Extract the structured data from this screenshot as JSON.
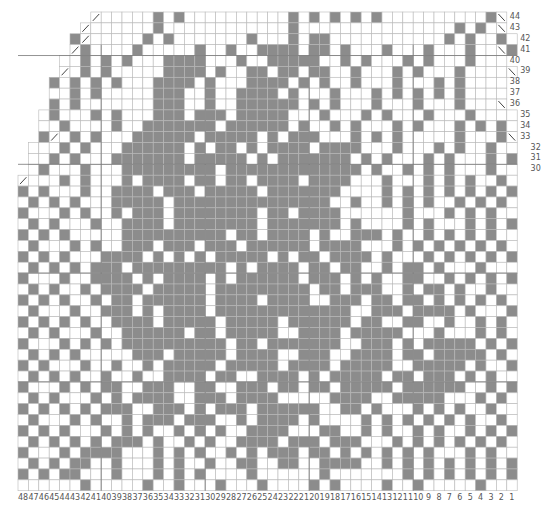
{
  "colors": {
    "dark": "#8c8c8c",
    "light": "#ffffff",
    "grid": "#b8b8b8",
    "major": "#777777"
  },
  "columns": 48,
  "rows": 44,
  "column_labels": [
    "48",
    "47",
    "46",
    "45",
    "44",
    "43",
    "42",
    "41",
    "40",
    "39",
    "38",
    "37",
    "36",
    "35",
    "34",
    "33",
    "32",
    "31",
    "30",
    "29",
    "28",
    "27",
    "26",
    "25",
    "24",
    "23",
    "22",
    "21",
    "20",
    "19",
    "18",
    "17",
    "16",
    "15",
    "14",
    "13",
    "12",
    "11",
    "10",
    "9",
    "8",
    "7",
    "6",
    "5",
    "4",
    "3",
    "2",
    "1"
  ],
  "row_labels": [
    "1",
    "2",
    "3",
    "4",
    "5",
    "6",
    "7",
    "8",
    "9",
    "10",
    "11",
    "12",
    "13",
    "14",
    "15",
    "16",
    "17",
    "18",
    "19",
    "20",
    "21",
    "22",
    "23",
    "24",
    "25",
    "26",
    "27",
    "28",
    "29",
    "30",
    "31",
    "32",
    "33",
    "34",
    "35",
    "36",
    "37",
    "38",
    "39",
    "40",
    "41",
    "42",
    "43",
    "44"
  ],
  "legend": {
    "dark_cell": "contrast color",
    "light_cell": "main color",
    "diagonal": "decrease"
  },
  "pattern_rows_top_to_bottom": [
    "       /.....#.#..........#.#.#.#.#..........#\\      ",
    "      /......#............#...............#.#.\\     ",
    "     #/.....#.#.......#...#.##...........#.#..#.    ",
    "     /#....#.....#..#..####.##.#...#...#...#..\\#    ",
    "    ..#.#.#...####...#..#####..#.#...#.#...#...    ",
    "    /.#.#.....####.#..##.##.##..#...#.#...#....\\   ",
    "   #.#.#.#...####.#...####.#.#..#...#...#.#....   ",
    "   ..#.#.....###..#..####.#...#...#.#.#.#.#....   ",
    "   #.#.......###..#..######.#.#...#...#...#...\\   ",
    "  .#...#.#...###.###.#####...#...#.#...#...#....  ",
    "  ..#....#..#######.######.#..#.#...#.#...#.#.#.  ",
    "  #/.#.#...######.#####.#.###...#.#.#.....#...#\\  ",
    " ...#.#...######.#.##.#.####.####...#...#.#..#... ",
    " ..#.#...#######.#####.#.#######.#.#...#.#...#.#. ",
    " .#...#...#########.#############.#..#.#.#...#... ",
    "/...#.#...#.####.##.##.####.####...#...#.#.#..#.\\#",
    "#.#...#..####.###.#####.#######....#.#.#.#.#.#.#.#",
    ".#.#.#...#####.###############..#..#.#.#..#.#.#..#",
    "#...#.#..#.###.########.##.####......#...#.#.#...#",
    ".#.#...#..####.########.#######.#....#.#...#.#.#..",
    "#.#.#.....##########.##.####.#..###.#..#.#.#.#...#",
    ".#...#.#..###.###.###.######.####...#.#.#.#.#.#...",
    "#.#.#...####.#.#.#.#####.#.##.####.#...#.#.#.#.#.#",
    ".#.#.#.###.#########.#.####.##.##..#.##.#...#...#.",
    "#...#..####.#.####.#.######.###.#.#..##..#.#.#.#.#",
    ".#.#..#.####.#####.#########.##.###..#.##.#..#..#.",
    "#.#.#..#.##.######.####.####..###.##.##.#.#.#.#..#",
    ".#...#..###.#.####.#############..###.####.#...#..",
    "#.#.#.#..####.#####.#####.######.##..##..#..#.#..#",
    ".#.#...#..######.##.#####..####.#####...#...#.#..#",
    "#...#.#.#.##########.##.#######..###.#.#####.#.#..",
    ".#.#.#.....###.#####.####..###..####.##.#####.#.#.",
    "#.#...#..#..#.#####.#####.####.#####..#####.#..#..",
    ".#.#.#..#..#..####.##..####.#.#####.##.###.#.#..#.",
    "#...#.#.##..###..##..###.##.##.#####.######..#.#.#",
    ".#.#...#.#.####..###.####.....####..#####...#.#.#.",
    "#.#.#.#.###..###.#.###.######..##.#...#.#.#..#..#.",
    ".#...#.#..#.###.###..#.####.#....#.#.#.#.#.#..#.#.",
    "#.#.#...#.#.#..#.#.#..####...##..#.#..#.#..#.#.#..",
    ".#.#.#.#.###.#..#.#..####.###.###...#.#.#.#.#.#.#.",
    "#...#.####...#.#.#..#.#.###.##.#.#.#.#.#...#.#..#.",
    ".#.#.##..#...#.#..#..##..##..####..#.#.#.#.#.#.#..",
    "#.#.##...#...#.#.#....#......#.......#.#.#.#.#.#.#",
    "......#.....#..#...#...#....#.#....#..#.....#....#."
  ]
}
